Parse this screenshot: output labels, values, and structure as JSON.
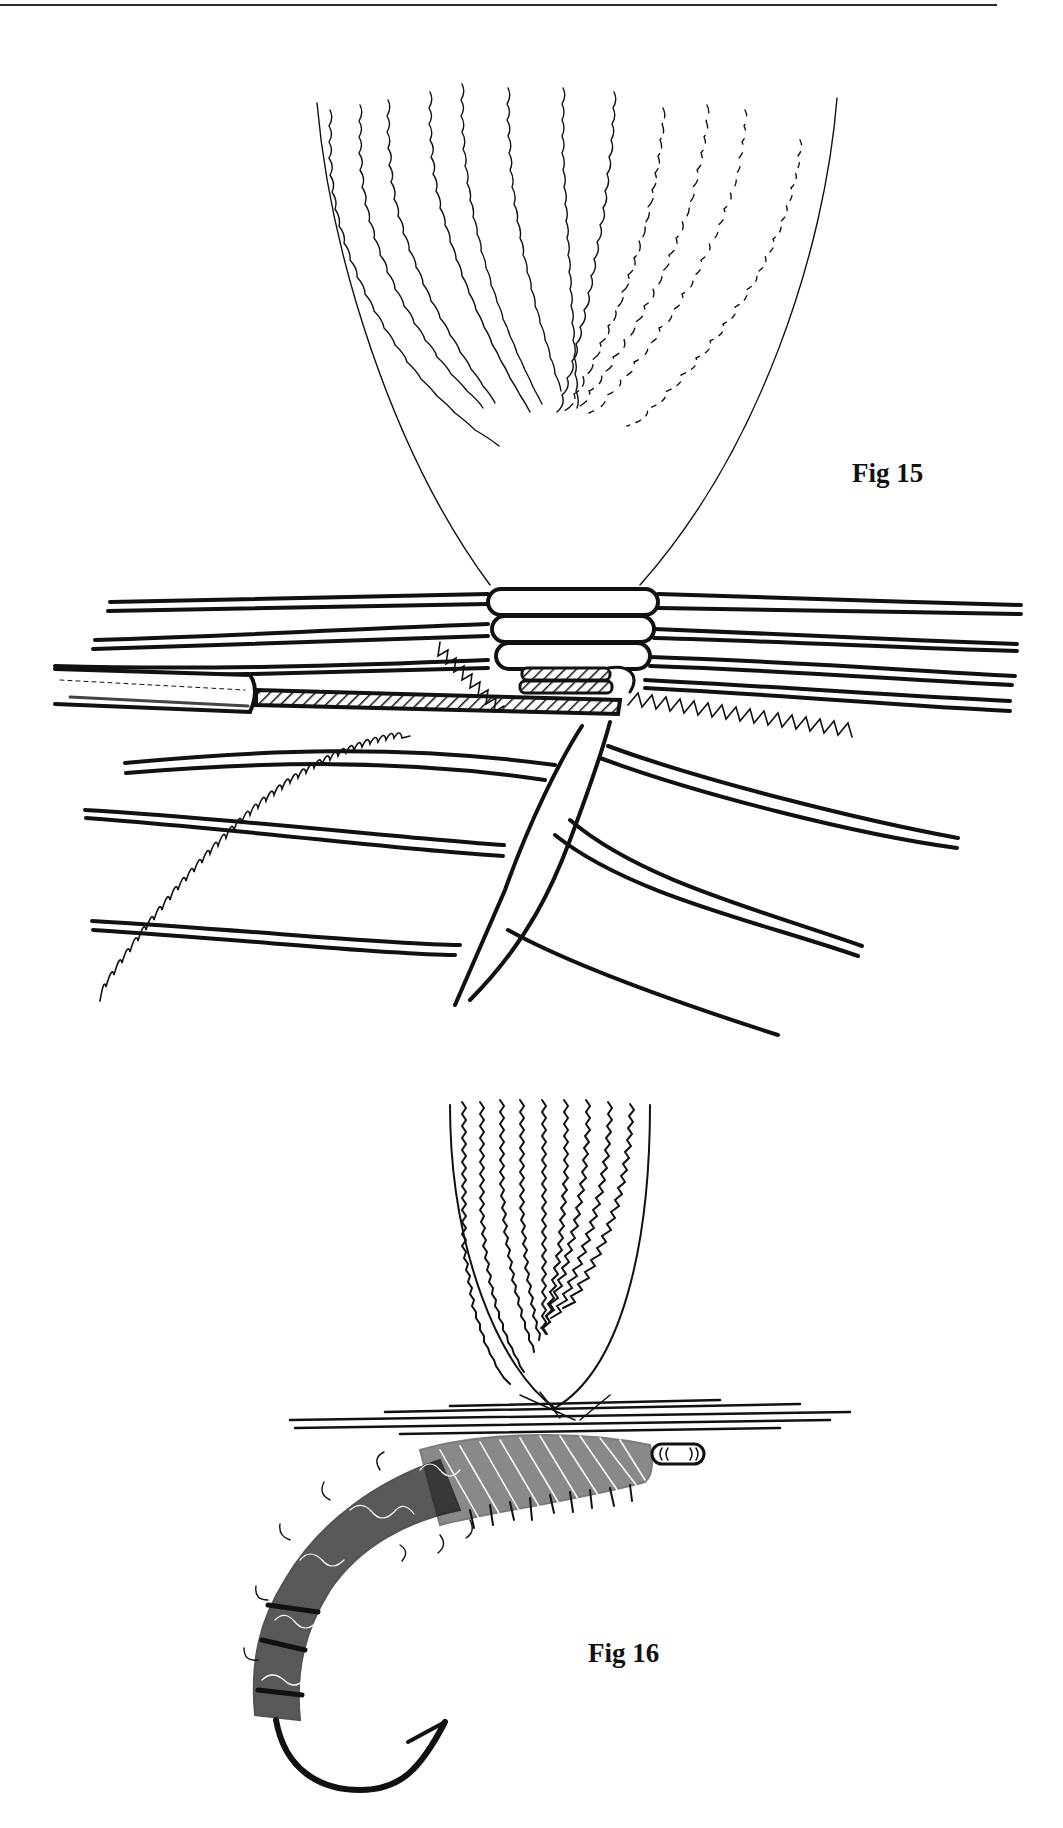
{
  "page": {
    "background": "#ffffff",
    "ink": "#111111"
  },
  "figures": [
    {
      "id": "fig15",
      "label": "Fig 15",
      "label_position": {
        "x": 852,
        "y": 464
      },
      "subject": "hackle fibres tied in above hook shank with thread wraps, wire rib and tube"
    },
    {
      "id": "fig16",
      "label": "Fig 16",
      "label_position": {
        "x": 588,
        "y": 1645
      },
      "subject": "completed nymph/sedge pupa fly on curved hook with dubbed body and hackle"
    }
  ]
}
